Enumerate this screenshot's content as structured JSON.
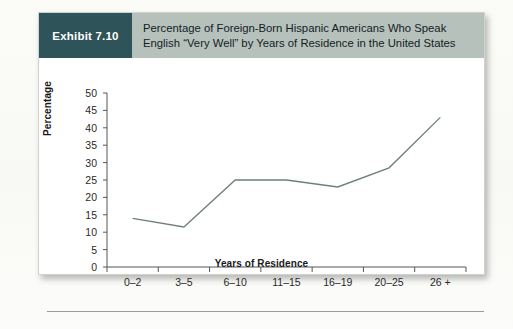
{
  "exhibit": {
    "badge_label": "Exhibit 7.10",
    "title_line_1": "Percentage of Foreign-Born Hispanic Americans Who Speak",
    "title_line_2": "English “Very Well” by Years of Residence in the United States",
    "badge_color": "#2e5358",
    "header_color": "#b7c1bc"
  },
  "chart_data": {
    "type": "line",
    "title": "Percentage of Foreign-Born Hispanic Americans Who Speak English “Very Well” by Years of Residence in the United States",
    "xlabel": "Years of Residence",
    "ylabel": "Percentage",
    "categories": [
      "0–2",
      "3–5",
      "6–10",
      "11–15",
      "16–19",
      "20–25",
      "26 +"
    ],
    "values": [
      14,
      11.5,
      25,
      25,
      23,
      28.5,
      43
    ],
    "ylim": [
      0,
      50
    ],
    "ytick_step": 5,
    "yticks": [
      0,
      5,
      10,
      15,
      20,
      25,
      30,
      35,
      40,
      45,
      50
    ],
    "grid": false,
    "legend": null,
    "line_color": "#6d7f7b",
    "line_width": 1.3
  }
}
